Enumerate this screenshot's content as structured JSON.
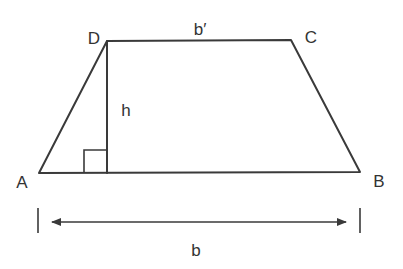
{
  "diagram": {
    "type": "trapezoid",
    "stroke_color": "#3a3a3a",
    "vertices": {
      "A": {
        "label": "A",
        "x": 39,
        "y": 173
      },
      "B": {
        "label": "B",
        "x": 360,
        "y": 172
      },
      "C": {
        "label": "C",
        "x": 291,
        "y": 40
      },
      "D": {
        "label": "D",
        "x": 107,
        "y": 41
      }
    },
    "height": {
      "label": "h",
      "from": "D",
      "foot": {
        "x": 107,
        "y": 173
      }
    },
    "top_base": {
      "label": "b′",
      "from": "D",
      "to": "C"
    },
    "bottom_base": {
      "label": "b",
      "from": "A",
      "to": "B"
    },
    "right_angle_marker": {
      "x": 84,
      "y": 150,
      "size": 23
    },
    "dimension_arrow": {
      "label": "b",
      "y": 222,
      "x_start": 50,
      "x_end": 348,
      "tick_left_x": 38,
      "tick_right_x": 360
    }
  }
}
